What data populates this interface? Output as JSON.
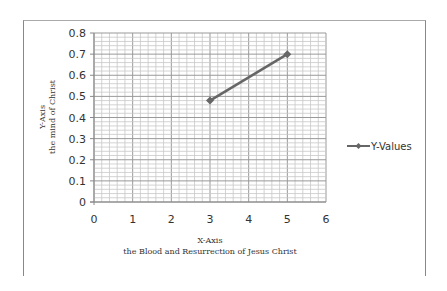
{
  "chart_data": {
    "type": "line",
    "title": "",
    "xlabel": "X-Axis",
    "xlabel_sub": "the Blood and Resurrection of Jesus Christ",
    "ylabel": "Y-Axis",
    "ylabel_sub": "the mind of Christ",
    "xlim": [
      0,
      6
    ],
    "ylim": [
      0,
      0.8
    ],
    "xticks": [
      "0",
      "1",
      "2",
      "3",
      "4",
      "5",
      "6"
    ],
    "yticks": [
      "0",
      "0.1",
      "0.2",
      "0.3",
      "0.4",
      "0.5",
      "0.6",
      "0.7",
      "0.8"
    ],
    "grid": true,
    "legend_position": "right",
    "series": [
      {
        "name": "Y-Values",
        "x": [
          3,
          5
        ],
        "values": [
          0.48,
          0.7
        ],
        "color": "#666666",
        "marker": "diamond"
      }
    ]
  }
}
